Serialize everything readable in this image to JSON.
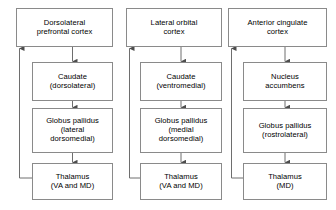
{
  "diagram": {
    "type": "flow-diagram",
    "background_color": "#ffffff",
    "box_border_color": "#8a8a8a",
    "connector_color": "#6e6e6e",
    "text_color": "#000000",
    "columns": [
      {
        "id": "dorsolateral-prefrontal-circuit",
        "nodes": [
          {
            "id": "dlpfc",
            "role": "cortex",
            "lines": [
              "Dorsolateral",
              "prefrontal cortex"
            ],
            "x": 16,
            "y": 8,
            "width": 97,
            "height": 39
          },
          {
            "id": "caudate-dorsolateral",
            "role": "striatum",
            "lines": [
              "Caudate",
              "(dorsolateral)"
            ],
            "x": 32,
            "y": 62,
            "width": 81,
            "height": 39
          },
          {
            "id": "globus-pallidus-lateral-dorsomedial",
            "role": "pallidum",
            "lines": [
              "Globus pallidus",
              "(lateral",
              "dorsomedial)"
            ],
            "x": 32,
            "y": 108,
            "width": 81,
            "height": 45
          },
          {
            "id": "thalamus-va-md-1",
            "role": "thalamus",
            "lines": [
              "Thalamus",
              "(VA and MD)"
            ],
            "x": 32,
            "y": 163,
            "width": 81,
            "height": 37
          }
        ],
        "feedback": {
          "from": "thalamus-va-md-1",
          "to": "dlpfc",
          "lane_x": 19
        }
      },
      {
        "id": "lateral-orbital-circuit",
        "nodes": [
          {
            "id": "loc",
            "role": "cortex",
            "lines": [
              "Lateral orbital",
              "cortex"
            ],
            "x": 126,
            "y": 8,
            "width": 96,
            "height": 39
          },
          {
            "id": "caudate-ventromedial",
            "role": "striatum",
            "lines": [
              "Caudate",
              "(ventromedial)"
            ],
            "x": 140,
            "y": 62,
            "width": 82,
            "height": 39
          },
          {
            "id": "globus-pallidus-medial-dorsomedial",
            "role": "pallidum",
            "lines": [
              "Globus pallidus",
              "(medial",
              "dorsomedial)"
            ],
            "x": 140,
            "y": 108,
            "width": 82,
            "height": 45
          },
          {
            "id": "thalamus-va-md-2",
            "role": "thalamus",
            "lines": [
              "Thalamus",
              "(VA and MD)"
            ],
            "x": 140,
            "y": 163,
            "width": 82,
            "height": 37
          }
        ],
        "feedback": {
          "from": "thalamus-va-md-2",
          "to": "loc",
          "lane_x": 129
        }
      },
      {
        "id": "anterior-cingulate-circuit",
        "nodes": [
          {
            "id": "acc",
            "role": "cortex",
            "lines": [
              "Anterior cingulate",
              "cortex"
            ],
            "x": 228,
            "y": 8,
            "width": 99,
            "height": 39
          },
          {
            "id": "nucleus-accumbens",
            "role": "striatum",
            "lines": [
              "Nucleus",
              "accumbens"
            ],
            "x": 243,
            "y": 62,
            "width": 84,
            "height": 39
          },
          {
            "id": "globus-pallidus-rostrolateral",
            "role": "pallidum",
            "lines": [
              "Globus pallidus",
              "(rostrolateral)"
            ],
            "x": 243,
            "y": 108,
            "width": 84,
            "height": 45
          },
          {
            "id": "thalamus-md",
            "role": "thalamus",
            "lines": [
              "Thalamus",
              "(MD)"
            ],
            "x": 243,
            "y": 163,
            "width": 84,
            "height": 37
          }
        ],
        "feedback": {
          "from": "thalamus-md",
          "to": "acc",
          "lane_x": 231
        }
      }
    ]
  }
}
